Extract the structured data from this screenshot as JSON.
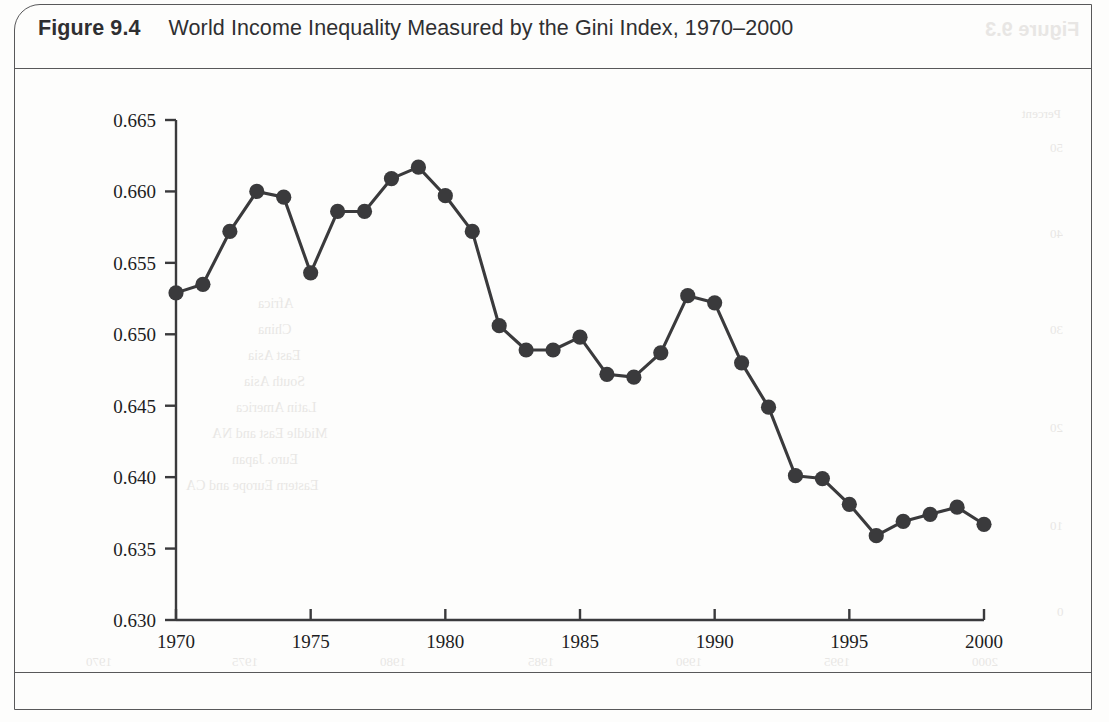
{
  "figure": {
    "label": "Figure 9.4",
    "caption": "World Income Inequality Measured by the Gini Index, 1970–2000"
  },
  "bleedthrough": {
    "title": "Figure 9.3",
    "legend": [
      "Africa",
      "China",
      "East Asia",
      "South Asia",
      "Latin America",
      "Middle East and NA",
      "Euro. Japan",
      "Eastern Europe and CA"
    ],
    "axis_label": "Percent",
    "y_ticks": [
      "50",
      "40",
      "30",
      "20",
      "10",
      "0"
    ],
    "x_ticks": [
      "1970",
      "1975",
      "1980",
      "1985",
      "1990",
      "1995",
      "2000"
    ]
  },
  "chart_data": {
    "type": "line",
    "title": "World Income Inequality Measured by the Gini Index, 1970–2000",
    "xlabel": "",
    "ylabel": "",
    "grid": false,
    "legend": null,
    "marker": "filled-circle",
    "line_color": "#3a3a3c",
    "marker_color": "#3a3a3c",
    "xlim": [
      1970,
      2000
    ],
    "ylim": [
      0.63,
      0.665
    ],
    "x_ticks": [
      1970,
      1975,
      1980,
      1985,
      1990,
      1995,
      2000
    ],
    "x_tick_labels": [
      "1970",
      "1975",
      "1980",
      "1985",
      "1990",
      "1995",
      "2000"
    ],
    "y_ticks": [
      0.63,
      0.635,
      0.64,
      0.645,
      0.65,
      0.655,
      0.66,
      0.665
    ],
    "y_tick_labels": [
      "0.630",
      "0.635",
      "0.640",
      "0.645",
      "0.650",
      "0.655",
      "0.660",
      "0.665"
    ],
    "x": [
      1970,
      1971,
      1972,
      1973,
      1974,
      1975,
      1976,
      1977,
      1978,
      1979,
      1980,
      1981,
      1982,
      1983,
      1984,
      1985,
      1986,
      1987,
      1988,
      1989,
      1990,
      1991,
      1992,
      1993,
      1994,
      1995,
      1996,
      1997,
      1998,
      1999,
      2000
    ],
    "values": [
      0.6529,
      0.6535,
      0.6572,
      0.66,
      0.6596,
      0.6543,
      0.6586,
      0.6586,
      0.6609,
      0.6617,
      0.6597,
      0.6572,
      0.6506,
      0.6489,
      0.6489,
      0.6498,
      0.6472,
      0.647,
      0.6487,
      0.6527,
      0.6522,
      0.648,
      0.6449,
      0.6401,
      0.6399,
      0.6381,
      0.6359,
      0.6369,
      0.6374,
      0.6379,
      0.6367
    ],
    "series_name": "World Gini index"
  }
}
